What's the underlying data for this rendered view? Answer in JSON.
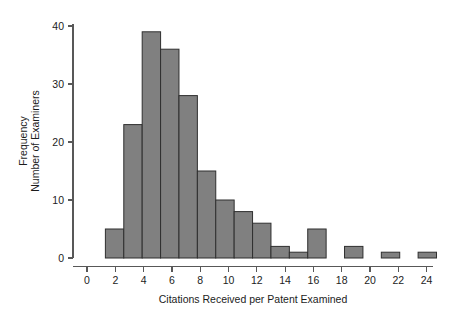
{
  "chart_data": {
    "type": "bar",
    "title": "",
    "subtitle": "",
    "xlabel": "Citations Received per Patent Examined",
    "ylabel_lines": [
      "Frequency",
      "Number of Examiners"
    ],
    "ylabel": "Frequency Number of Examiners",
    "xlim": [
      0,
      25.2
    ],
    "ylim": [
      0,
      41.5
    ],
    "xticks": [
      0,
      2,
      4,
      6,
      8,
      10,
      12,
      14,
      16,
      18,
      20,
      22,
      24
    ],
    "xtick_labels": [
      "0",
      "2",
      "4",
      "6",
      "8",
      "10",
      "12",
      "14",
      "16",
      "18",
      "20",
      "22",
      "24"
    ],
    "yticks": [
      0,
      10,
      20,
      30,
      40
    ],
    "ytick_labels": [
      "0",
      "10",
      "20",
      "30",
      "40"
    ],
    "grid": false,
    "legend": false,
    "legend_position": "none",
    "bar_fill_color": "#808080",
    "bar_edge_color": "#2f2f2f",
    "axis_color": "#585858",
    "bin_width": 1.3,
    "bins": [
      {
        "x0": 1.3,
        "x1": 2.6,
        "value": 5
      },
      {
        "x0": 2.6,
        "x1": 3.9,
        "value": 23
      },
      {
        "x0": 3.9,
        "x1": 5.2,
        "value": 39
      },
      {
        "x0": 5.2,
        "x1": 6.5,
        "value": 36
      },
      {
        "x0": 6.5,
        "x1": 7.8,
        "value": 28
      },
      {
        "x0": 7.8,
        "x1": 9.1,
        "value": 15
      },
      {
        "x0": 9.1,
        "x1": 10.4,
        "value": 10
      },
      {
        "x0": 10.4,
        "x1": 11.7,
        "value": 8
      },
      {
        "x0": 11.7,
        "x1": 13.0,
        "value": 6
      },
      {
        "x0": 13.0,
        "x1": 14.3,
        "value": 2
      },
      {
        "x0": 14.3,
        "x1": 15.6,
        "value": 1
      },
      {
        "x0": 15.6,
        "x1": 16.9,
        "value": 5
      },
      {
        "x0": 16.9,
        "x1": 18.2,
        "value": 0
      },
      {
        "x0": 18.2,
        "x1": 19.5,
        "value": 2
      },
      {
        "x0": 19.5,
        "x1": 20.8,
        "value": 0
      },
      {
        "x0": 20.8,
        "x1": 22.1,
        "value": 1
      },
      {
        "x0": 22.1,
        "x1": 23.4,
        "value": 0
      },
      {
        "x0": 23.4,
        "x1": 24.7,
        "value": 1
      }
    ],
    "categories": [
      "1.3-2.6",
      "2.6-3.9",
      "3.9-5.2",
      "5.2-6.5",
      "6.5-7.8",
      "7.8-9.1",
      "9.1-10.4",
      "10.4-11.7",
      "11.7-13.0",
      "13.0-14.3",
      "14.3-15.6",
      "15.6-16.9",
      "16.9-18.2",
      "18.2-19.5",
      "19.5-20.8",
      "20.8-22.1",
      "22.1-23.4",
      "23.4-24.7"
    ],
    "values": [
      5,
      23,
      39,
      36,
      28,
      15,
      10,
      8,
      6,
      2,
      1,
      5,
      0,
      2,
      0,
      1,
      0,
      1
    ]
  }
}
